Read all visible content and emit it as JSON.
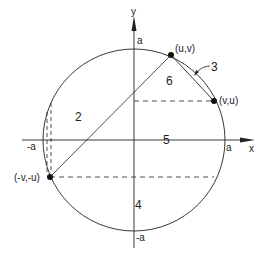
{
  "diagram": {
    "axes": {
      "x_label": "x",
      "y_label": "y",
      "tick_labels": {
        "pos_x": "a",
        "neg_x": "-a",
        "pos_y": "a",
        "neg_y": "-a"
      }
    },
    "points": [
      {
        "id": "p1",
        "label": "(u,v)"
      },
      {
        "id": "p2",
        "label": "(v,u)"
      },
      {
        "id": "p3",
        "label": "(-v,-u)"
      }
    ],
    "region_labels": {
      "r2": "2",
      "r3": "3",
      "r4": "4",
      "r5": "5",
      "r6": "6"
    },
    "colors": {
      "stroke": "#222222",
      "background": "#ffffff"
    }
  }
}
